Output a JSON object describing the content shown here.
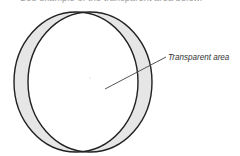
{
  "caption": {
    "text": "See example of the transparent area below."
  },
  "diagram": {
    "label": "Transparent area",
    "colors": {
      "stroke": "#222222",
      "fill_overlap_band": "#e6e6e6",
      "leader_line": "#555555",
      "background": "#ffffff"
    }
  }
}
